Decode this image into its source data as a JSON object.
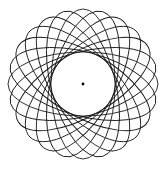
{
  "figure": {
    "type": "spirograph-rotated-ellipses",
    "ellipse_count": 12,
    "rotation_step_degrees": 15,
    "semi_major_to_minor_ratio": 2.34,
    "has_center_dot": true,
    "colors": {
      "background": "#ffffff",
      "stroke": "#1a1a1a",
      "center_dot": "#000000"
    }
  }
}
